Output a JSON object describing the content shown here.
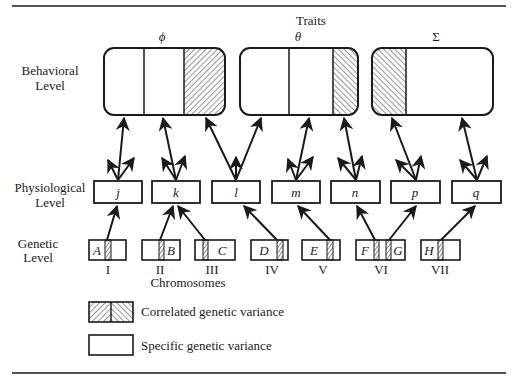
{
  "diagram": {
    "header": {
      "traits_label": "Traits"
    },
    "levels": {
      "behavioral": {
        "line1": "Behavioral",
        "line2": "Level"
      },
      "physiological": {
        "line1": "Physiological",
        "line2": "Level"
      },
      "genetic": {
        "line1": "Genetic",
        "line2": "Level"
      }
    },
    "traits": [
      {
        "symbol": "ϕ"
      },
      {
        "symbol": "θ"
      },
      {
        "symbol": "Σ"
      }
    ],
    "physiological_nodes": [
      {
        "label": "j"
      },
      {
        "label": "k"
      },
      {
        "label": "l"
      },
      {
        "label": "m"
      },
      {
        "label": "n"
      },
      {
        "label": "p"
      },
      {
        "label": "q"
      }
    ],
    "genes": [
      {
        "label": "A"
      },
      {
        "label": "B"
      },
      {
        "label": "C"
      },
      {
        "label": "D"
      },
      {
        "label": "E"
      },
      {
        "label": "F"
      },
      {
        "label": "G"
      },
      {
        "label": "H"
      }
    ],
    "chromosomes": {
      "title": "Chromosomes",
      "numerals": [
        "I",
        "II",
        "III",
        "IV",
        "V",
        "VI",
        "VII"
      ]
    },
    "legend": {
      "correlated": "Correlated genetic variance",
      "specific": "Specific genetic variance"
    },
    "colors": {
      "ink": "#1a1a1a",
      "background": "#ffffff"
    }
  }
}
